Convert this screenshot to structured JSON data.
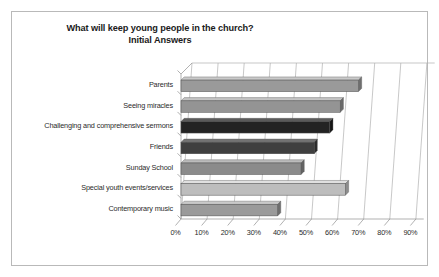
{
  "figure": {
    "title": "What will keep young people in the church?",
    "subtitle": "Initial Answers"
  },
  "chart_data": {
    "type": "bar",
    "orientation": "horizontal",
    "title": "What will keep young people in the church?",
    "subtitle": "Initial Answers",
    "xlabel": "",
    "ylabel": "",
    "xlim": [
      0,
      93
    ],
    "xticks": [
      0,
      10,
      20,
      30,
      40,
      50,
      60,
      70,
      80,
      90
    ],
    "xticklabels": [
      "0%",
      "10%",
      "20%",
      "30%",
      "40%",
      "50%",
      "60%",
      "70%",
      "80%",
      "90%"
    ],
    "grid": true,
    "legend": false,
    "style": "3d-bar",
    "categories": [
      "Parents",
      "Seeing miracles",
      "Challenging and comprehensive sermons",
      "Friends",
      "Sunday School",
      "Special youth events/services",
      "Contemporary music"
    ],
    "values": [
      68,
      61,
      57,
      51,
      46,
      63,
      37
    ],
    "bar_colors": [
      "#9a9a9a",
      "#949494",
      "#232323",
      "#3f3f3f",
      "#8b8b8b",
      "#bdbdbd",
      "#9a9a9a"
    ],
    "bar_top_colors": [
      "#c9c9c9",
      "#c4c4c4",
      "#5a5a5a",
      "#737373",
      "#bcbcbc",
      "#e0e0e0",
      "#c9c9c9"
    ],
    "bar_side_colors": [
      "#6e6e6e",
      "#6a6a6a",
      "#141414",
      "#2a2a2a",
      "#636363",
      "#8d8d8d",
      "#6e6e6e"
    ]
  },
  "axis_colors": {
    "grid": "#b0b0b0",
    "axis": "#8f8f8f",
    "frame": "#b9b9b9",
    "text": "#2b2b2b"
  }
}
